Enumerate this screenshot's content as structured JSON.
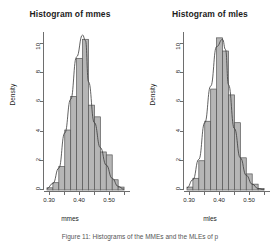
{
  "figure": {
    "caption_line1": "Figure 11: Histograms of the MMEs and the MLEs of p",
    "caption_line2": ""
  },
  "panels": [
    {
      "title": "Histogram of mmes",
      "xlabel": "mmes",
      "ylabel": "Density"
    },
    {
      "title": "Histogram of mles",
      "xlabel": "mles",
      "ylabel": "Density"
    }
  ],
  "chart_data": [
    {
      "type": "bar",
      "title": "Histogram of mmes",
      "xlabel": "mmes",
      "ylabel": "Density",
      "xlim": [
        0.27,
        0.56
      ],
      "ylim": [
        0,
        10.8
      ],
      "grid": false,
      "legend": null,
      "bin_width": 0.02,
      "bin_edges": [
        0.28,
        0.3,
        0.32,
        0.34,
        0.36,
        0.38,
        0.4,
        0.42,
        0.44,
        0.46,
        0.48,
        0.5,
        0.52,
        0.54
      ],
      "values": [
        0.15,
        0.5,
        1.6,
        4.1,
        6.4,
        9.0,
        10.3,
        5.8,
        5.0,
        2.6,
        2.4,
        0.7,
        0.2
      ],
      "x_ticks": [
        0.3,
        0.35,
        0.4,
        0.45,
        0.5,
        0.55
      ],
      "x_tick_labels": [
        "0.30",
        "",
        "0.40",
        "",
        "0.50",
        ""
      ],
      "y_ticks": [
        0,
        2,
        4,
        6,
        8,
        10
      ],
      "y_tick_labels": [
        "0",
        "2",
        "4",
        "6",
        "8",
        "10"
      ],
      "density_curve": {
        "label": "density overlay",
        "x": [
          0.28,
          0.3,
          0.32,
          0.34,
          0.36,
          0.38,
          0.4,
          0.41,
          0.42,
          0.44,
          0.46,
          0.48,
          0.5,
          0.52,
          0.54
        ],
        "y": [
          0.1,
          0.45,
          1.5,
          3.9,
          6.2,
          9.1,
          10.6,
          10.2,
          7.4,
          4.6,
          2.9,
          1.7,
          0.8,
          0.25,
          0.05
        ]
      }
    },
    {
      "type": "bar",
      "title": "Histogram of mles",
      "xlabel": "mles",
      "ylabel": "Density",
      "xlim": [
        0.27,
        0.56
      ],
      "ylim": [
        0,
        10.8
      ],
      "grid": false,
      "legend": null,
      "bin_width": 0.02,
      "bin_edges": [
        0.28,
        0.3,
        0.32,
        0.34,
        0.36,
        0.38,
        0.4,
        0.42,
        0.44,
        0.46,
        0.48,
        0.5,
        0.52,
        0.54
      ],
      "values": [
        0.2,
        0.8,
        2.0,
        4.7,
        6.9,
        10.4,
        9.5,
        6.5,
        4.6,
        2.2,
        1.1,
        0.4,
        0.1
      ],
      "x_ticks": [
        0.3,
        0.35,
        0.4,
        0.45,
        0.5,
        0.55
      ],
      "x_tick_labels": [
        "0.30",
        "",
        "0.40",
        "",
        "0.50",
        ""
      ],
      "y_ticks": [
        0,
        2,
        4,
        6,
        8,
        10
      ],
      "y_tick_labels": [
        "0",
        "2",
        "4",
        "6",
        "8",
        "10"
      ],
      "density_curve": {
        "label": "density overlay",
        "x": [
          0.28,
          0.3,
          0.32,
          0.34,
          0.36,
          0.38,
          0.4,
          0.41,
          0.42,
          0.44,
          0.46,
          0.48,
          0.5,
          0.52,
          0.54
        ],
        "y": [
          0.15,
          0.7,
          2.1,
          4.6,
          7.1,
          9.8,
          10.3,
          9.6,
          7.2,
          4.2,
          2.2,
          1.0,
          0.4,
          0.1,
          0.02
        ]
      }
    }
  ]
}
